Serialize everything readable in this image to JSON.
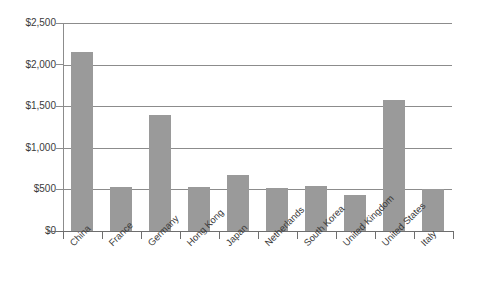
{
  "chart_data": {
    "type": "bar",
    "title": "",
    "subtitle": "",
    "xlabel": "",
    "ylabel": "",
    "categories": [
      "China",
      "France",
      "Germany",
      "Hong Kong",
      "Japan",
      "Netherlands",
      "South Korea",
      "United Kingdom",
      "United States",
      "Italy"
    ],
    "values": [
      2150,
      530,
      1400,
      530,
      670,
      520,
      545,
      430,
      1570,
      510
    ],
    "ylim": [
      0,
      2500
    ],
    "yticks": [
      0,
      500,
      1000,
      1500,
      2000,
      2500
    ],
    "ytick_labels": [
      "$0",
      "$500",
      "$1,000",
      "$1,500",
      "$2,000",
      "$2,500"
    ],
    "grid": true,
    "grid_axis": "y",
    "legend": false,
    "legend_position": "none",
    "bar_color": "#9a9a9a",
    "grid_color": "#8c8c8c",
    "axis_color": "#6e6e6e",
    "background": "#ffffff",
    "value_prefix": "$",
    "xtick_label_rotation": -45
  }
}
